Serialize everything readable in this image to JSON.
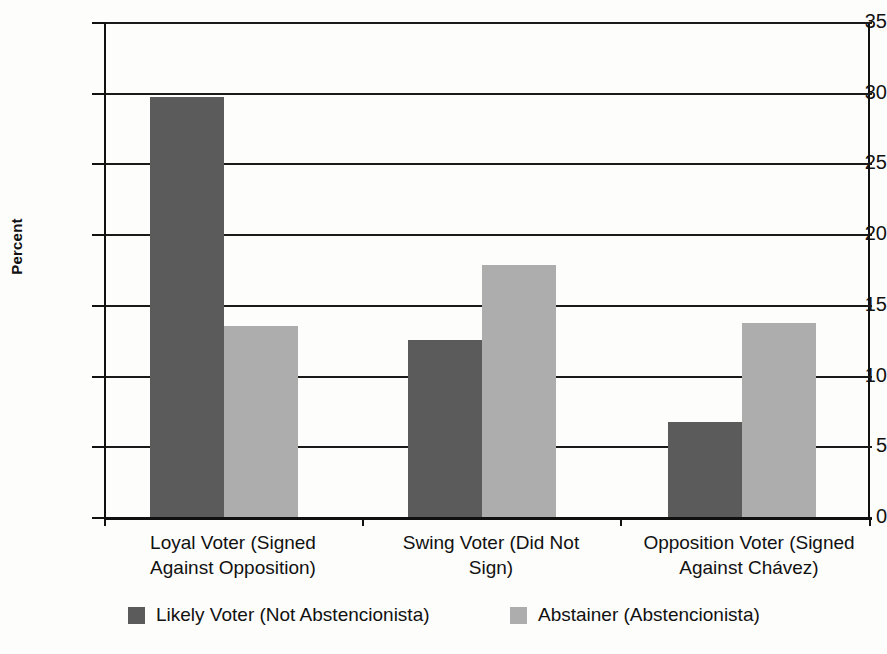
{
  "chart_data": {
    "type": "bar",
    "title": "",
    "xlabel": "",
    "ylabel": "Percent",
    "ylim": [
      0,
      35
    ],
    "ytick_step": 5,
    "yticks": [
      "35",
      "30",
      "25",
      "20",
      "15",
      "10",
      "5",
      "0"
    ],
    "grid": true,
    "legend_position": "bottom",
    "categories": [
      "Loyal Voter (Signed Against Opposition)",
      "Swing Voter (Did Not Sign)",
      "Opposition Voter (Signed Against Chávez)"
    ],
    "category_lines": [
      [
        "Loyal Voter (Signed",
        "Against Opposition)"
      ],
      [
        "Swing Voter (Did Not",
        "Sign)"
      ],
      [
        "Opposition Voter (Signed",
        "Against Chávez)"
      ]
    ],
    "series": [
      {
        "name": "Likely Voter (Not Abstencionista)",
        "color": "#5b5b5b",
        "values": [
          29.7,
          12.5,
          6.7
        ]
      },
      {
        "name": "Abstainer (Abstencionista)",
        "color": "#adadad",
        "values": [
          13.5,
          17.8,
          13.7
        ]
      }
    ]
  },
  "colors": {
    "dark_series": "#5b5b5b",
    "light_series": "#adadad",
    "axis": "#111111",
    "background": "#fdfdfc"
  },
  "legend": {
    "items": [
      {
        "label": "Likely Voter (Not Abstencionista)",
        "swatch": "dark"
      },
      {
        "label": "Abstainer (Abstencionista)",
        "swatch": "light"
      }
    ]
  }
}
